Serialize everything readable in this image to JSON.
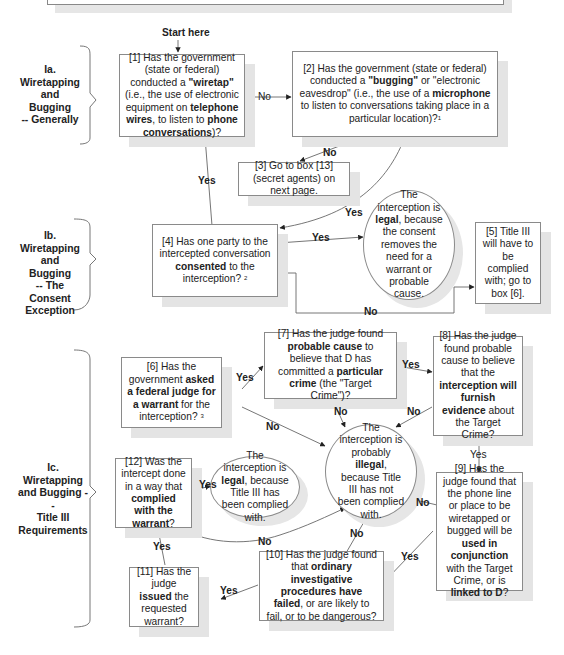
{
  "start_label": "Start here",
  "sections": [
    {
      "id": "Ia",
      "lines": [
        "Ia.",
        "Wiretapping",
        "and Bugging",
        "-- Generally"
      ]
    },
    {
      "id": "Ib",
      "lines": [
        "Ib.",
        "Wiretapping",
        "and Bugging",
        "-- The",
        "Consent",
        "Exception"
      ]
    },
    {
      "id": "Ic",
      "lines": [
        "Ic.",
        "Wiretapping",
        "and Bugging --",
        "Title III",
        "Requirements"
      ]
    }
  ],
  "nodes": {
    "box1": {
      "parts": [
        "[1] Has the government (state or federal) conducted a ",
        {
          "b": "\"wiretap\""
        },
        " (i.e., the use of electronic equipment on ",
        {
          "b": "telephone wires"
        },
        ", to listen to ",
        {
          "b": "phone conversations"
        },
        ")?"
      ]
    },
    "box2": {
      "parts": [
        "[2] Has the government (state or federal) conducted a ",
        {
          "b": "\"bugging\""
        },
        " or \"electronic eavesdrop\" (i.e., the use of a ",
        {
          "b": "microphone"
        },
        " to listen to conversations taking place in a particular location)?",
        {
          "sup": "1"
        }
      ]
    },
    "box3": {
      "parts": [
        "[3] Go to box [13] (secret agents) on next page."
      ]
    },
    "box4": {
      "parts": [
        "[4] Has one party to the intercepted conversation ",
        {
          "b": "consented"
        },
        " to the interception? ",
        {
          "sup": "2"
        }
      ]
    },
    "circle_legal_consent": {
      "parts": [
        "The interception is ",
        {
          "b": "legal"
        },
        ", because the consent removes the need for a warrant or probable cause."
      ]
    },
    "box5": {
      "parts": [
        "[5] Title III will have to be complied with; go to box [6]."
      ]
    },
    "box6": {
      "parts": [
        "[6] Has the government ",
        {
          "b": "asked a federal judge for a warrant"
        },
        " for the interception? ",
        {
          "sup": "3"
        }
      ]
    },
    "box7": {
      "parts": [
        "[7] Has the judge found ",
        {
          "b": "probable cause"
        },
        " to believe that D has committed a ",
        {
          "b": "particular crime"
        },
        " (the \"Target Crime\")?"
      ]
    },
    "box8": {
      "parts": [
        "[8] Has the judge found probable cause to believe that the ",
        {
          "b": "interception will furnish evidence"
        },
        " about the Target Crime?"
      ]
    },
    "circle_illegal": {
      "parts": [
        "The interception is probably ",
        {
          "b": "illegal"
        },
        ", because Title III has not been complied with."
      ]
    },
    "box12": {
      "parts": [
        "[12] Was the intercept done in a way that ",
        {
          "b": "complied with the warrant"
        },
        "?"
      ]
    },
    "circle_legal_title3": {
      "parts": [
        "The interception is ",
        {
          "b": "legal"
        },
        ", because Title III has been complied with."
      ]
    },
    "box9": {
      "parts": [
        "[9] Has the judge found that the phone line or place to be wiretapped or bugged will be ",
        {
          "b": "used in conjunction"
        },
        " with the Target Crime, or is ",
        {
          "b": "linked to D"
        },
        "?"
      ]
    },
    "box10": {
      "parts": [
        "[10] Has the judge found that ",
        {
          "b": "ordinary investigative procedures have failed"
        },
        ", or are likely to fail, or to be dangerous?"
      ]
    },
    "box11": {
      "parts": [
        "[11] Has the judge ",
        {
          "b": "issued"
        },
        " the requested warrant?"
      ]
    }
  },
  "edge_labels": {
    "e1_2": "No",
    "e2_3": "No",
    "e1_4": "Yes",
    "e2_4": "Yes",
    "e4_legal": "Yes",
    "e4_5": "No",
    "e6_7": "Yes",
    "e6_ill": "No",
    "e7_8": "Yes",
    "e7_ill": "No",
    "e8_ill": "No",
    "e8_9": "Yes",
    "e9_ill": "No",
    "e9_10": "Yes",
    "e10_ill": "No",
    "e10_11": "Yes",
    "e11_12": "Yes",
    "e12_legal": "Yes",
    "e12_ill": "No"
  }
}
